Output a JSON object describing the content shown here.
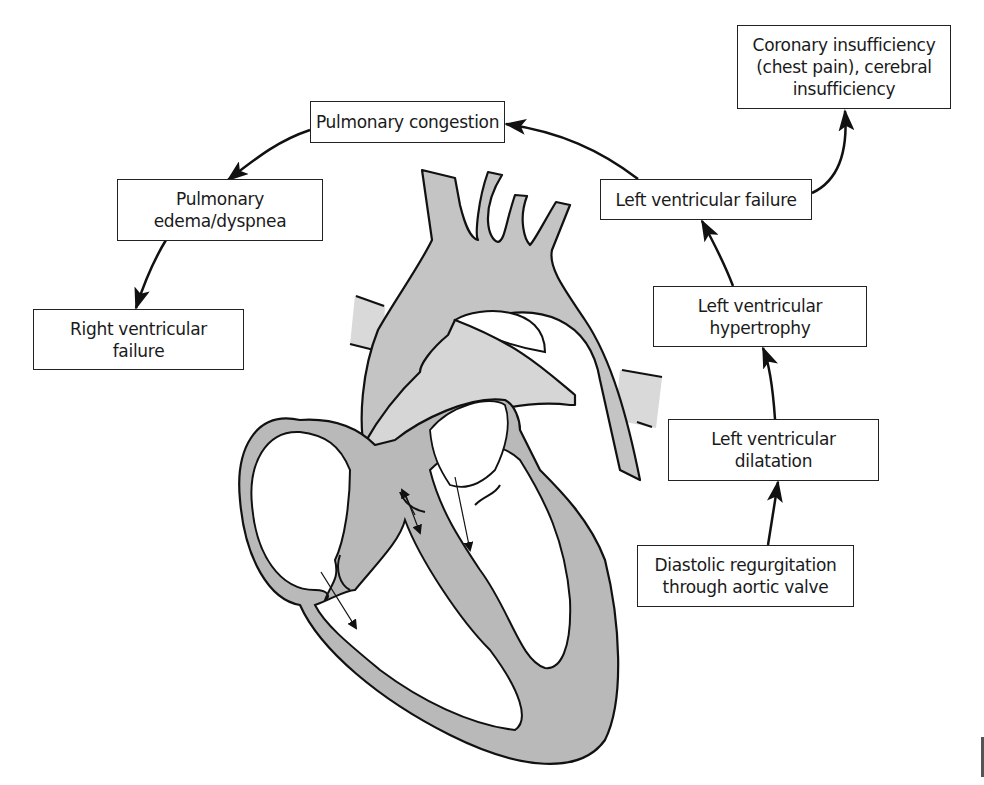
{
  "diagram": {
    "colors": {
      "tissue_dark": "#b8b8b8",
      "tissue_light": "#d6d6d6",
      "vessel": "#c9c9c9",
      "outline": "#111111",
      "box_border": "#222222",
      "background": "#ffffff"
    },
    "nodes": {
      "coronary": {
        "lines": [
          "Coronary insufficiency",
          "(chest pain), cerebral",
          "insufficiency"
        ]
      },
      "pulmonary_congestion": {
        "lines": [
          "Pulmonary congestion"
        ]
      },
      "pulmonary_edema": {
        "lines": [
          "Pulmonary",
          "edema/dyspnea"
        ]
      },
      "right_vf": {
        "lines": [
          "Right ventricular",
          "failure"
        ]
      },
      "left_vf": {
        "lines": [
          "Left ventricular failure"
        ]
      },
      "lv_hypertrophy": {
        "lines": [
          "Left ventricular",
          "hypertrophy"
        ]
      },
      "lv_dilatation": {
        "lines": [
          "Left ventricular",
          "dilatation"
        ]
      },
      "diastolic_regurg": {
        "lines": [
          "Diastolic regurgitation",
          "through aortic valve"
        ]
      }
    },
    "edges": [
      {
        "from": "Diastolic regurgitation through aortic valve",
        "to": "Left ventricular dilatation"
      },
      {
        "from": "Left ventricular dilatation",
        "to": "Left ventricular hypertrophy"
      },
      {
        "from": "Left ventricular hypertrophy",
        "to": "Left ventricular failure"
      },
      {
        "from": "Left ventricular failure",
        "to": "Coronary insufficiency (chest pain), cerebral insufficiency"
      },
      {
        "from": "Left ventricular failure",
        "to": "Pulmonary congestion"
      },
      {
        "from": "Pulmonary congestion",
        "to": "Pulmonary edema/dyspnea"
      },
      {
        "from": "Pulmonary edema/dyspnea",
        "to": "Right ventricular failure"
      }
    ],
    "illustration": "heart-cross-section-icon"
  }
}
